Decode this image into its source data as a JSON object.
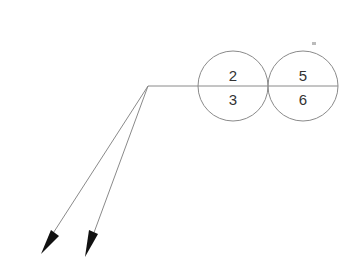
{
  "diagram": {
    "type": "ballooned-leader",
    "colors": {
      "line": "#8a8a8a",
      "text": "#333333",
      "arrow": "#111111",
      "background": "#ffffff"
    },
    "balloons": [
      {
        "top": "2",
        "bottom": "3"
      },
      {
        "top": "5",
        "bottom": "6"
      }
    ],
    "leaders": [
      {
        "name": "leader-1",
        "arrowhead": "filled"
      },
      {
        "name": "leader-2",
        "arrowhead": "filled"
      }
    ]
  }
}
